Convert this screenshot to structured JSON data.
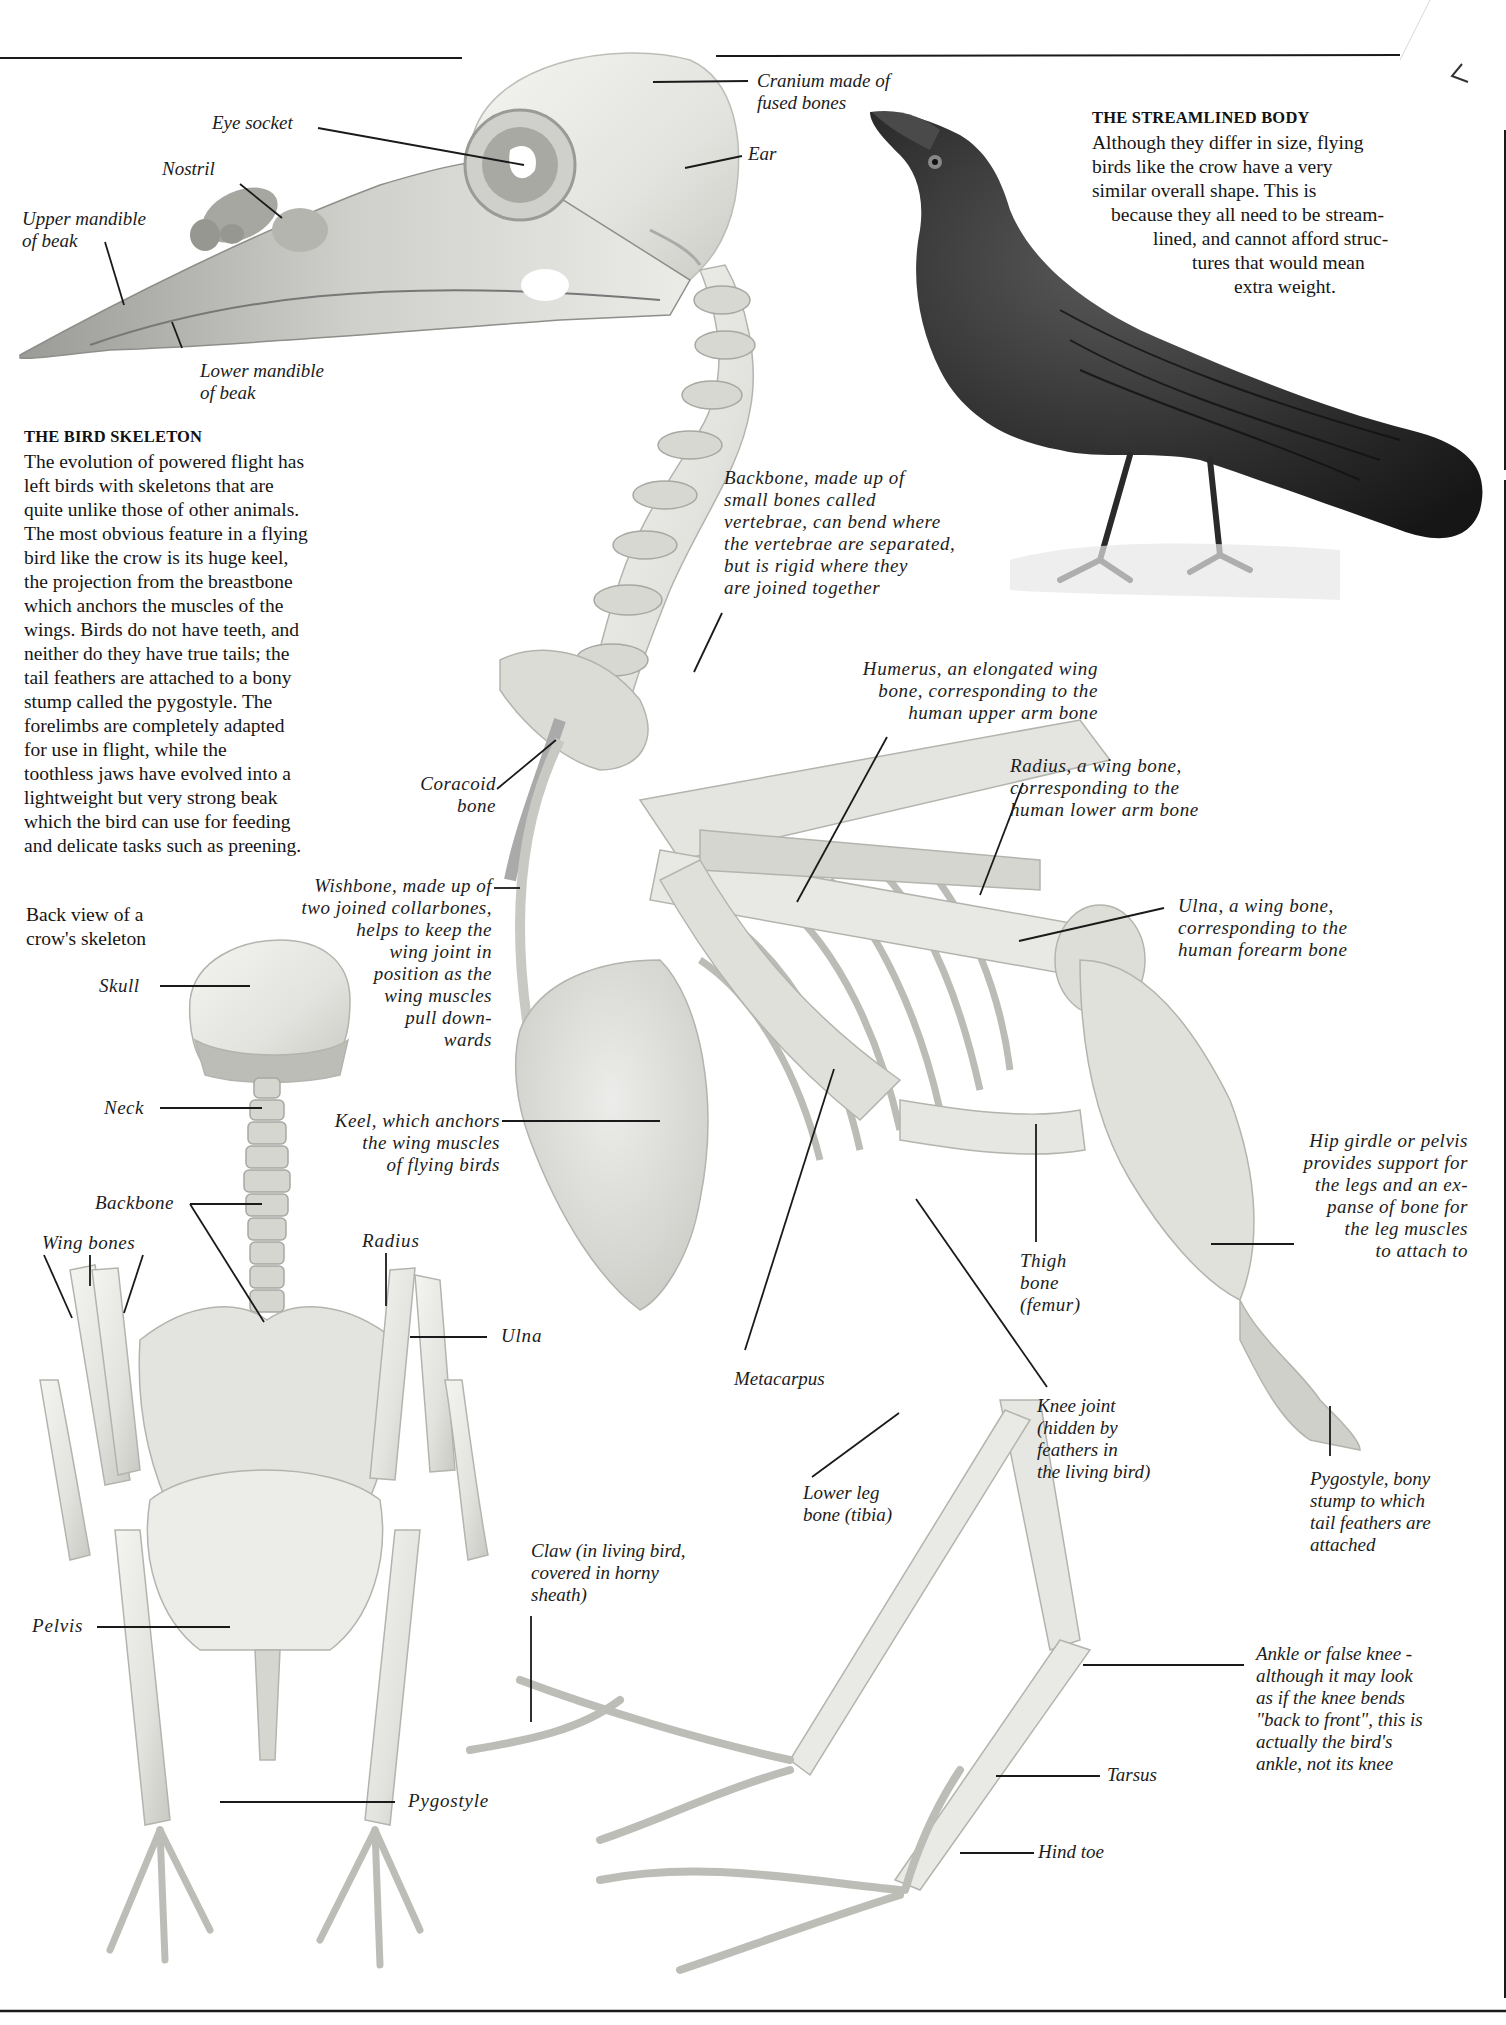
{
  "streamlined_body": {
    "heading": "THE STREAMLINED BODY",
    "lines": [
      "Although they differ in size, flying",
      "birds like the crow have a very",
      "similar overall shape. This is",
      "because they all need to be stream-",
      "lined, and cannot afford struc-",
      "tures that would mean",
      "extra weight."
    ]
  },
  "bird_skeleton": {
    "heading": "THE BIRD SKELETON",
    "lines": [
      "The evolution of powered flight has",
      "left birds with skeletons that are",
      "quite unlike those of other animals.",
      "The most obvious feature in a flying",
      "bird like the crow is its huge keel,",
      "the projection from the breastbone",
      "which anchors the muscles of the",
      "wings. Birds do not have teeth, and",
      "neither do they have true tails; the",
      "tail feathers are attached to a bony",
      "stump called the pygostyle. The",
      "forelimbs are completely adapted",
      "for use in flight, while the",
      "toothless jaws have evolved into a",
      "lightweight but very strong beak",
      "which the bird can use for feeding",
      "and delicate tasks such as preening."
    ]
  },
  "back_view_caption": "Back view of a\ncrow's skeleton",
  "skull_labels": {
    "eye_socket": "Eye socket",
    "nostril": "Nostril",
    "upper_mandible": "Upper mandible\nof beak",
    "lower_mandible": "Lower mandible\nof beak",
    "cranium": "Cranium made of\nfused bones",
    "ear": "Ear"
  },
  "side_labels": {
    "backbone": "Backbone, made up of\nsmall bones called\nvertebrae, can bend where\nthe vertebrae are separated,\nbut is rigid where they\nare joined together",
    "humerus": "Humerus, an elongated wing\nbone, corresponding to the\nhuman upper arm bone",
    "radius": "Radius, a wing bone,\ncorresponding to the\nhuman lower arm bone",
    "ulna": "Ulna, a wing bone,\ncorresponding to the\nhuman forearm bone",
    "coracoid": "Coracoid\nbone",
    "wishbone": "Wishbone, made up of\ntwo joined collarbones,\nhelps to keep the\nwing joint in\nposition as the\nwing muscles\npull down-\nwards",
    "keel": "Keel, which anchors\nthe wing muscles\nof flying birds",
    "hip_girdle": "Hip girdle or pelvis\nprovides support for\nthe legs and an ex-\npanse of bone for\nthe leg muscles\nto attach to",
    "thigh": "Thigh\nbone\n(femur)",
    "metacarpus": "Metacarpus",
    "knee_joint": "Knee joint\n(hidden by\nfeathers in\nthe living bird)",
    "pygostyle": "Pygostyle, bony\nstump to which\ntail feathers are\nattached",
    "lower_leg": "Lower leg\nbone (tibia)",
    "claw": "Claw (in living bird,\ncovered in horny\nsheath)",
    "ankle": "Ankle or false knee -\nalthough it may look\nas if the knee bends\n\"back to front\", this is\nactually the bird's\nankle, not its knee",
    "tarsus": "Tarsus",
    "hind_toe": "Hind toe"
  },
  "back_labels": {
    "skull": "Skull",
    "neck": "Neck",
    "backbone": "Backbone",
    "wing_bones": "Wing bones",
    "radius": "Radius",
    "ulna": "Ulna",
    "pelvis": "Pelvis",
    "pygostyle": "Pygostyle"
  },
  "colors": {
    "bone": "#e9e9e6",
    "bone_shadow": "#bdbdb8",
    "crow": "#2b2b2b",
    "rule": "#1a1a1a"
  }
}
